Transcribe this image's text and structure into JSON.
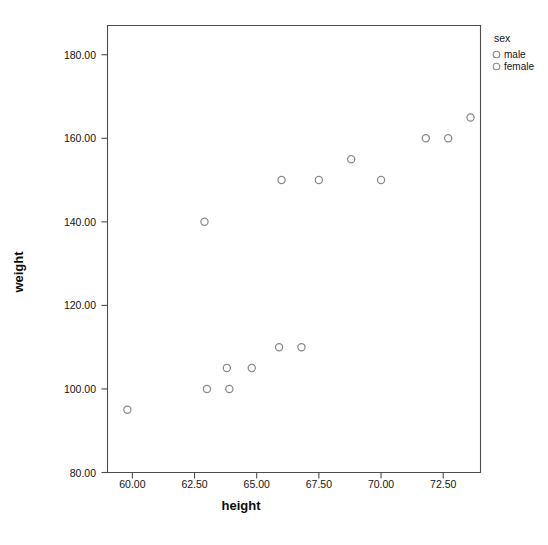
{
  "chart_data": {
    "type": "scatter",
    "title": "",
    "xlabel": "height",
    "ylabel": "weight",
    "xlim": [
      59.0,
      74.0
    ],
    "ylim": [
      80.0,
      187.0
    ],
    "xticks": [
      "60.00",
      "62.50",
      "65.00",
      "67.50",
      "70.00",
      "72.50"
    ],
    "xtick_values": [
      60.0,
      62.5,
      65.0,
      67.5,
      70.0,
      72.5
    ],
    "yticks": [
      "80.00",
      "100.00",
      "120.00",
      "140.00",
      "160.00",
      "180.00"
    ],
    "ytick_values": [
      80.0,
      100.0,
      120.0,
      140.0,
      160.0,
      180.0
    ],
    "grid": false,
    "legend": {
      "title": "sex",
      "position": "right-top",
      "entries": [
        {
          "label": "male",
          "marker": "open-circle"
        },
        {
          "label": "female",
          "marker": "open-circle"
        }
      ]
    },
    "marker_style": "open-circle",
    "marker_color": "#8a8a8a",
    "series": [
      {
        "name": "all",
        "points": [
          {
            "x": 59.8,
            "y": 95
          },
          {
            "x": 62.9,
            "y": 140
          },
          {
            "x": 63.0,
            "y": 100
          },
          {
            "x": 63.8,
            "y": 105
          },
          {
            "x": 63.9,
            "y": 100
          },
          {
            "x": 64.8,
            "y": 105
          },
          {
            "x": 65.9,
            "y": 110
          },
          {
            "x": 66.0,
            "y": 150
          },
          {
            "x": 66.8,
            "y": 110
          },
          {
            "x": 67.5,
            "y": 150
          },
          {
            "x": 68.8,
            "y": 155
          },
          {
            "x": 70.0,
            "y": 150
          },
          {
            "x": 71.8,
            "y": 160
          },
          {
            "x": 72.7,
            "y": 160
          },
          {
            "x": 73.6,
            "y": 165
          }
        ]
      }
    ]
  }
}
